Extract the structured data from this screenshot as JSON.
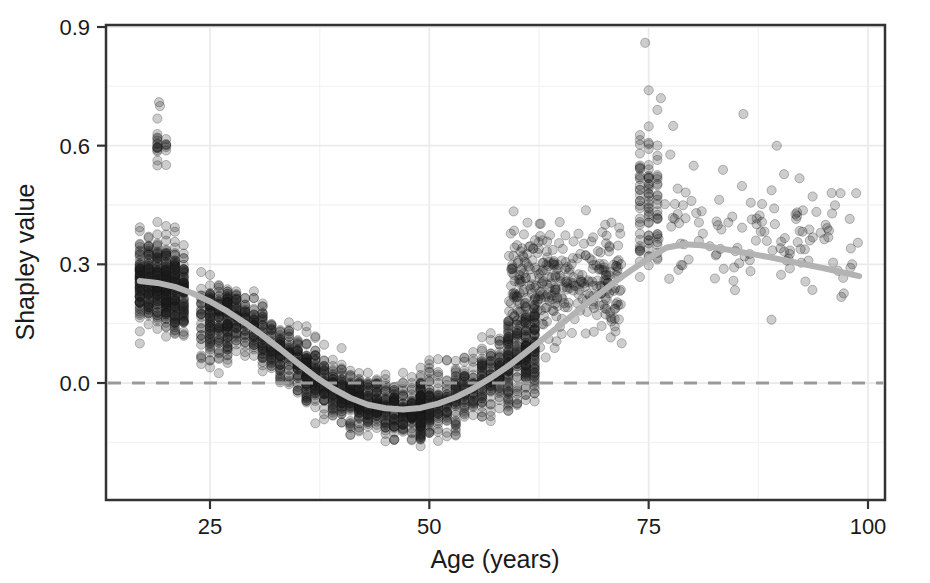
{
  "chart_data": {
    "type": "scatter",
    "title": "",
    "xlabel": "Age (years)",
    "ylabel": "Shapley value",
    "xlim": [
      16,
      101
    ],
    "ylim": [
      -0.22,
      0.93
    ],
    "xticks": [
      25,
      50,
      75,
      100
    ],
    "xtick_labels": [
      "25",
      "50",
      "75",
      "100"
    ],
    "yticks": [
      0.0,
      0.3,
      0.6,
      0.9
    ],
    "ytick_labels": [
      "0.0",
      "0.3",
      "0.6",
      "0.9"
    ],
    "minor_yticks": [
      -0.15,
      0.15,
      0.45,
      0.75
    ],
    "minor_xticks": [
      37.5,
      62.5,
      87.5
    ],
    "grid": true,
    "legend": "none",
    "point_color": "#1a1a1a",
    "point_opacity": 0.22,
    "point_radius": 4.6,
    "reference_line": {
      "y": 0.0,
      "style": "dashed",
      "color": "#9a9a9a"
    },
    "smooth_curve": {
      "name": "loess smooth",
      "color": "#b3b3b3",
      "width": 6,
      "x": [
        17,
        19,
        21,
        23,
        25,
        27,
        29,
        31,
        33,
        35,
        37,
        39,
        41,
        43,
        45,
        47,
        49,
        51,
        53,
        55,
        57,
        59,
        61,
        63,
        65,
        67,
        69,
        71,
        73,
        75,
        77,
        79,
        81,
        83,
        85,
        87,
        89,
        91,
        93,
        95,
        97,
        99
      ],
      "y": [
        0.258,
        0.253,
        0.243,
        0.227,
        0.206,
        0.181,
        0.152,
        0.12,
        0.086,
        0.05,
        0.016,
        -0.014,
        -0.038,
        -0.055,
        -0.064,
        -0.067,
        -0.063,
        -0.052,
        -0.036,
        -0.014,
        0.013,
        0.043,
        0.077,
        0.112,
        0.148,
        0.184,
        0.219,
        0.253,
        0.285,
        0.315,
        0.342,
        0.351,
        0.348,
        0.341,
        0.333,
        0.325,
        0.317,
        0.308,
        0.299,
        0.29,
        0.28,
        0.27
      ]
    },
    "clusters": [
      {
        "label": "dense-left-band",
        "x_range": [
          17,
          22
        ],
        "y_range": [
          -0.03,
          0.47
        ],
        "n": 520,
        "density": "very-high"
      },
      {
        "label": "high-outliers-19",
        "x_range": [
          18.6,
          19.8
        ],
        "y_range": [
          0.47,
          0.72
        ],
        "n": 22,
        "density": "low"
      },
      {
        "label": "band-25",
        "x_range": [
          24,
          27
        ],
        "y_range": [
          -0.08,
          0.39
        ],
        "n": 180,
        "density": "high"
      },
      {
        "label": "band-28-36",
        "x_range": [
          27,
          36
        ],
        "y_range": [
          -0.14,
          0.22
        ],
        "n": 420,
        "density": "very-high"
      },
      {
        "label": "trough-37-49",
        "x_range": [
          36,
          49
        ],
        "y_range": [
          -0.2,
          0.14
        ],
        "n": 700,
        "density": "very-high"
      },
      {
        "label": "rise-50-58",
        "x_range": [
          49,
          58
        ],
        "y_range": [
          -0.14,
          0.24
        ],
        "n": 420,
        "density": "very-high"
      },
      {
        "label": "column-59-61",
        "x_range": [
          58.5,
          61.5
        ],
        "y_range": [
          -0.06,
          0.46
        ],
        "n": 260,
        "density": "very-high"
      },
      {
        "label": "cloud-60-72",
        "x_range": [
          59,
          72
        ],
        "y_range": [
          -0.05,
          0.55
        ],
        "n": 330,
        "density": "medium"
      },
      {
        "label": "column-75",
        "x_range": [
          73.5,
          76.5
        ],
        "y_range": [
          0.03,
          0.86
        ],
        "n": 90,
        "density": "medium"
      },
      {
        "label": "sparse-right",
        "x_range": [
          76,
          99
        ],
        "y_range": [
          0.06,
          0.7
        ],
        "n": 120,
        "density": "low"
      }
    ],
    "notable_points": [
      {
        "x": 74.6,
        "y": 0.86
      },
      {
        "x": 19.2,
        "y": 0.71
      },
      {
        "x": 19.3,
        "y": 0.7
      },
      {
        "x": 75.0,
        "y": 0.74
      },
      {
        "x": 76.4,
        "y": 0.72
      },
      {
        "x": 85.8,
        "y": 0.68
      },
      {
        "x": 77.8,
        "y": 0.65
      },
      {
        "x": 89.6,
        "y": 0.6
      },
      {
        "x": 98.2,
        "y": 0.3
      },
      {
        "x": 89.0,
        "y": 0.16
      }
    ]
  },
  "axes": {
    "panel_border_color": "#333333",
    "grid_major_color": "#ebebeb",
    "grid_minor_color": "#f4f4f4",
    "panel_background": "#ffffff"
  }
}
